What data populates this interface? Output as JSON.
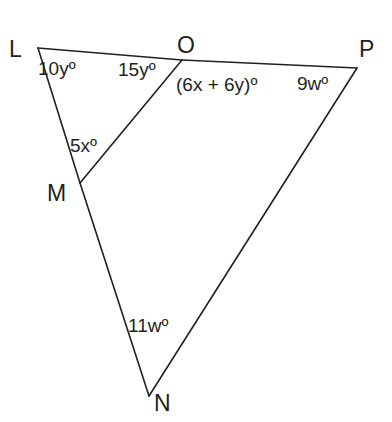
{
  "figure": {
    "stroke_color": "#231f20",
    "background_color": "#ffffff",
    "stroke_width": 1.6,
    "vertices": [
      {
        "name": "L",
        "label": "L",
        "x": 38,
        "y": 48,
        "label_x": 9,
        "label_y": 38
      },
      {
        "name": "O",
        "label": "O",
        "x": 182,
        "y": 60,
        "label_x": 177,
        "label_y": 34
      },
      {
        "name": "P",
        "label": "P",
        "x": 357,
        "y": 68,
        "label_x": 359,
        "label_y": 38
      },
      {
        "name": "M",
        "label": "M",
        "x": 80,
        "y": 183,
        "label_x": 47,
        "label_y": 182
      },
      {
        "name": "N",
        "label": "N",
        "x": 149,
        "y": 396,
        "label_x": 154,
        "label_y": 392
      }
    ],
    "segments": [
      {
        "name": "segment-L-O",
        "from": "L",
        "to": "O"
      },
      {
        "name": "segment-O-P",
        "from": "O",
        "to": "P"
      },
      {
        "name": "segment-L-M",
        "from": "L",
        "to": "M"
      },
      {
        "name": "segment-M-N",
        "from": "M",
        "to": "N"
      },
      {
        "name": "segment-O-M",
        "from": "O",
        "to": "M"
      },
      {
        "name": "segment-P-N",
        "from": "P",
        "to": "N"
      }
    ],
    "angle_labels": [
      {
        "name": "angle-label-10y",
        "text": "10yº",
        "x": 38,
        "y": 59,
        "at_vertex": "L"
      },
      {
        "name": "angle-label-15y",
        "text": "15yº",
        "x": 118,
        "y": 60,
        "at_vertex": "O"
      },
      {
        "name": "angle-label-6x-plus-6y",
        "text": "(6x + 6y)º",
        "x": 176,
        "y": 75,
        "at_vertex": "O"
      },
      {
        "name": "angle-label-9w",
        "text": "9wº",
        "x": 297,
        "y": 74,
        "at_vertex": "P"
      },
      {
        "name": "angle-label-5x",
        "text": "5xº",
        "x": 70,
        "y": 136,
        "at_vertex": "M"
      },
      {
        "name": "angle-label-11w",
        "text": "11wº",
        "x": 128,
        "y": 316,
        "at_vertex": "N"
      }
    ]
  }
}
